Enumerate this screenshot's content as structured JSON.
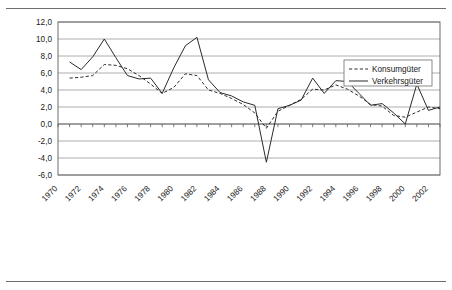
{
  "figure": {
    "name": "time-series-line-chart",
    "has_top_rule": true,
    "has_bottom_rule": true
  },
  "chart_data": {
    "type": "line",
    "title": "",
    "subtitle": "",
    "xlabel": "",
    "ylabel": "",
    "xlim": [
      1970,
      2003
    ],
    "ylim": [
      -6.0,
      12.0
    ],
    "ytick_step": 2.0,
    "grid": true,
    "grid_axis": "y",
    "legend_position": "top-right",
    "decimal_separator": ",",
    "x_tick_interval_years": 1,
    "x_label_interval_years": 2,
    "x_label_rotation_deg": 45,
    "x": [
      1970,
      1971,
      1972,
      1973,
      1974,
      1975,
      1976,
      1977,
      1978,
      1979,
      1980,
      1981,
      1982,
      1983,
      1984,
      1985,
      1986,
      1987,
      1988,
      1989,
      1990,
      1991,
      1992,
      1993,
      1994,
      1995,
      1996,
      1997,
      1998,
      1999,
      2000,
      2001,
      2002,
      2003
    ],
    "xticklabels": [
      "1970",
      "1972",
      "1974",
      "1976",
      "1978",
      "1980",
      "1982",
      "1984",
      "1986",
      "1988",
      "1990",
      "1992",
      "1994",
      "1996",
      "1998",
      "2000",
      "2002"
    ],
    "yticklabels": [
      "12,0",
      "10,0",
      "8,0",
      "6,0",
      "4,0",
      "2,0",
      "0,0",
      "-2,0",
      "-4,0",
      "-6,0"
    ],
    "ytickvalues": [
      12.0,
      10.0,
      8.0,
      6.0,
      4.0,
      2.0,
      0.0,
      -2.0,
      -4.0,
      -6.0
    ],
    "series": [
      {
        "name": "Konsumgüter",
        "style": "dashed",
        "color": "#2b2b2b",
        "x": [
          1971,
          1972,
          1973,
          1974,
          1975,
          1976,
          1977,
          1978,
          1979,
          1980,
          1981,
          1982,
          1983,
          1984,
          1985,
          1986,
          1987,
          1988,
          1989,
          1990,
          1991,
          1992,
          1993,
          1994,
          1995,
          1996,
          1997,
          1998,
          1999,
          2000,
          2001,
          2002,
          2003
        ],
        "values": [
          5.4,
          5.5,
          5.7,
          7.0,
          6.9,
          6.5,
          5.7,
          4.7,
          3.6,
          4.3,
          5.9,
          5.7,
          4.0,
          3.6,
          3.0,
          2.3,
          1.3,
          -0.5,
          1.5,
          2.2,
          2.9,
          4.1,
          4.0,
          4.6,
          4.1,
          3.3,
          2.3,
          2.1,
          1.0,
          0.8,
          1.4,
          2.0,
          1.8
        ]
      },
      {
        "name": "Verkehrsgüter",
        "style": "solid",
        "color": "#2b2b2b",
        "x": [
          1971,
          1972,
          1973,
          1974,
          1975,
          1976,
          1977,
          1978,
          1979,
          1980,
          1981,
          1982,
          1983,
          1984,
          1985,
          1986,
          1987,
          1988,
          1989,
          1990,
          1991,
          1992,
          1993,
          1994,
          1995,
          1996,
          1997,
          1998,
          1999,
          2000,
          2001,
          2002,
          2003
        ],
        "values": [
          7.3,
          6.4,
          7.9,
          10.0,
          7.8,
          5.7,
          5.3,
          5.4,
          3.6,
          6.6,
          9.2,
          10.2,
          5.2,
          3.7,
          3.3,
          2.6,
          2.2,
          -4.5,
          1.8,
          2.2,
          2.8,
          5.4,
          3.6,
          5.1,
          5.0,
          3.6,
          2.2,
          2.4,
          1.3,
          0.0,
          4.7,
          1.6,
          2.0
        ]
      }
    ],
    "legend_entries": [
      {
        "label": "Konsumgüter",
        "style": "dashed"
      },
      {
        "label": "Verkehrsgüter",
        "style": "solid"
      }
    ]
  }
}
